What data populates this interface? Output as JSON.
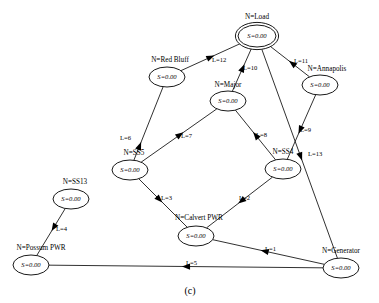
{
  "figure": {
    "caption": "(c)",
    "background_color": "#ffffff",
    "line_color": "#1a1a1a"
  },
  "diagram_data": {
    "type": "directed-graph",
    "node_state_label": "S=0.00",
    "nodes": [
      {
        "id": "load",
        "name": "N=Load",
        "state": "S=0.00",
        "cx": 257,
        "cy": 36,
        "rx": 19,
        "ry": 11,
        "double": true,
        "label_x": 257,
        "label_y": 17
      },
      {
        "id": "red_bluff",
        "name": "N=Red Bluff",
        "state": "S=0.00",
        "cx": 167,
        "cy": 77,
        "rx": 18,
        "ry": 10,
        "double": false,
        "label_x": 170,
        "label_y": 60
      },
      {
        "id": "annapolis",
        "name": "N=Annapolis",
        "state": "S=0.00",
        "cx": 320,
        "cy": 85,
        "rx": 18,
        "ry": 10,
        "double": false,
        "label_x": 327,
        "label_y": 69
      },
      {
        "id": "major",
        "name": "N=Major",
        "state": "S=0.00",
        "cx": 228,
        "cy": 101,
        "rx": 18,
        "ry": 10,
        "double": false,
        "label_x": 228,
        "label_y": 85
      },
      {
        "id": "ss5",
        "name": "N=SS5",
        "state": "S=0.00",
        "cx": 130,
        "cy": 170,
        "rx": 18,
        "ry": 10,
        "double": false,
        "label_x": 134,
        "label_y": 153
      },
      {
        "id": "ss13",
        "name": "N=SS13",
        "state": "S=0.00",
        "cx": 71,
        "cy": 199,
        "rx": 18,
        "ry": 10,
        "double": false,
        "label_x": 75,
        "label_y": 182
      },
      {
        "id": "ss4",
        "name": "N=SS4",
        "state": "S=0.00",
        "cx": 283,
        "cy": 169,
        "rx": 18,
        "ry": 10,
        "double": false,
        "label_x": 283,
        "label_y": 152
      },
      {
        "id": "calvert_pwr",
        "name": "N=Calvert PWR",
        "state": "S=0.00",
        "cx": 196,
        "cy": 236,
        "rx": 18,
        "ry": 10,
        "double": false,
        "label_x": 199,
        "label_y": 218
      },
      {
        "id": "possum_pwr",
        "name": "N=Possum PWR",
        "state": "S=0.00",
        "cx": 31,
        "cy": 265,
        "rx": 18,
        "ry": 10,
        "double": false,
        "label_x": 41,
        "label_y": 248
      },
      {
        "id": "generator",
        "name": "N=Generator",
        "state": "S=0.00",
        "cx": 341,
        "cy": 268,
        "rx": 18,
        "ry": 10,
        "double": false,
        "label_x": 341,
        "label_y": 251
      }
    ],
    "edges": [
      {
        "id": "L1",
        "label": "L=1",
        "from": "generator",
        "to": "calvert_pwr",
        "label_x": 265,
        "label_y": 249
      },
      {
        "id": "L2",
        "label": "L=2",
        "from": "ss4",
        "to": "calvert_pwr",
        "label_x": 239,
        "label_y": 198
      },
      {
        "id": "L3",
        "label": "L=3",
        "from": "ss5",
        "to": "calvert_pwr",
        "label_x": 161,
        "label_y": 198
      },
      {
        "id": "L4",
        "label": "L=4",
        "from": "ss13",
        "to": "possum_pwr",
        "label_x": 56,
        "label_y": 229
      },
      {
        "id": "L5",
        "label": "L=5",
        "from": "generator",
        "to": "possum_pwr",
        "label_x": 186,
        "label_y": 263
      },
      {
        "id": "L6",
        "label": "L=6",
        "from": "ss5",
        "to": "red_bluff",
        "label_x": 120,
        "label_y": 138
      },
      {
        "id": "L7",
        "label": "L=7",
        "from": "ss5",
        "to": "major",
        "label_x": 181,
        "label_y": 136
      },
      {
        "id": "L8",
        "label": "L=8",
        "from": "ss4",
        "to": "major",
        "label_x": 256,
        "label_y": 135
      },
      {
        "id": "L9",
        "label": "L=9",
        "from": "annapolis",
        "to": "ss4",
        "label_x": 300,
        "label_y": 130
      },
      {
        "id": "L10",
        "label": "L=10",
        "from": "major",
        "to": "load",
        "label_x": 243,
        "label_y": 68
      },
      {
        "id": "L11",
        "label": "L=11",
        "from": "annapolis",
        "to": "load",
        "label_x": 294,
        "label_y": 61
      },
      {
        "id": "L12",
        "label": "L=12",
        "from": "red_bluff",
        "to": "load",
        "label_x": 212,
        "label_y": 60
      },
      {
        "id": "L13",
        "label": "L=13",
        "from": "load",
        "to": "generator",
        "label_x": 308,
        "label_y": 154
      }
    ]
  }
}
